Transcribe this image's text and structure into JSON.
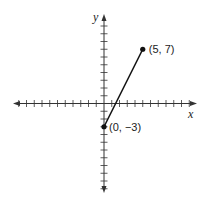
{
  "diagram": {
    "type": "coordinate-plane",
    "axes": {
      "x_label": "x",
      "y_label": "y",
      "x_ticks_range": [
        -11,
        11
      ],
      "y_ticks_range": [
        -11,
        10
      ],
      "arrows": true
    },
    "segment": {
      "start": {
        "x": 0,
        "y": -3,
        "label": "(0, −3)"
      },
      "end": {
        "x": 5,
        "y": 7,
        "label": "(5, 7)"
      }
    },
    "colors": {
      "axis": "#333333",
      "segment": "#111111",
      "point": "#111111"
    }
  },
  "render": {
    "origin_px": [
      104,
      103.5
    ],
    "unit_px": 7.75,
    "x_arrow_left_px": 13,
    "x_arrow_right_px": 197,
    "y_arrow_top_px": 14,
    "y_arrow_bottom_px": 193
  }
}
